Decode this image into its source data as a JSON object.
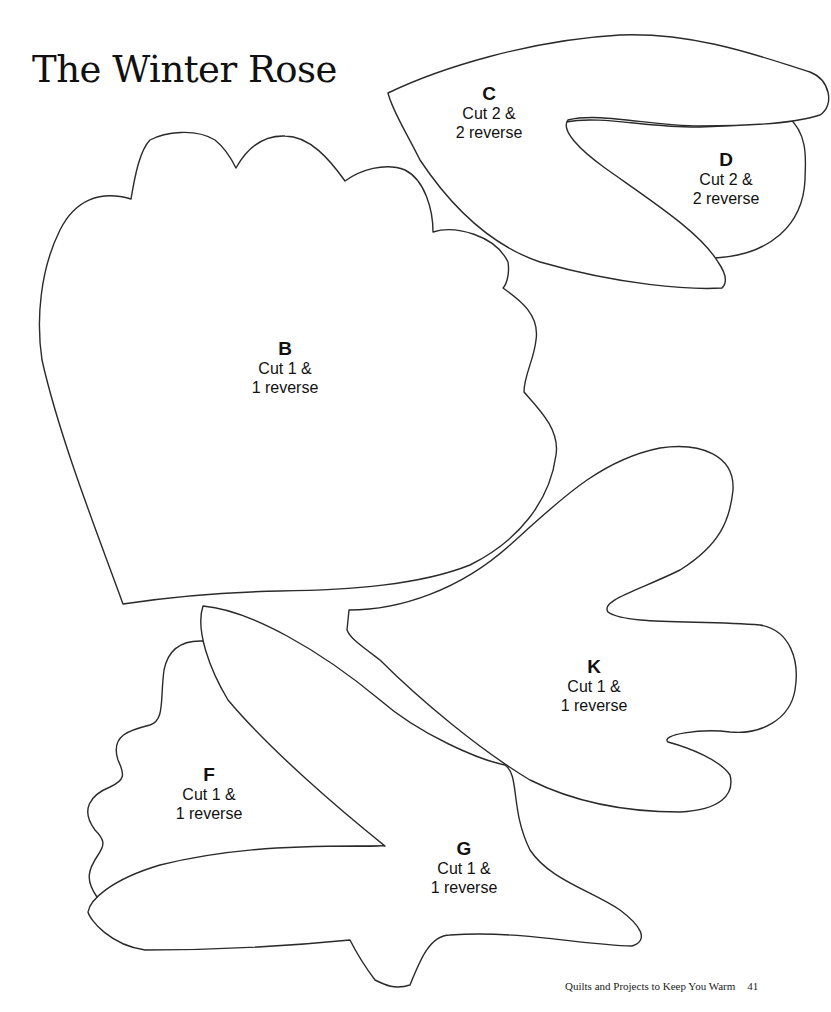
{
  "title": "The Winter Rose",
  "pieces": [
    {
      "id": "C",
      "letter": "C",
      "line1": "Cut 2 &",
      "line2": "2 reverse"
    },
    {
      "id": "D",
      "letter": "D",
      "line1": "Cut 2 &",
      "line2": "2 reverse"
    },
    {
      "id": "B",
      "letter": "B",
      "line1": "Cut 1 &",
      "line2": "1 reverse"
    },
    {
      "id": "K",
      "letter": "K",
      "line1": "Cut 1 &",
      "line2": "1 reverse"
    },
    {
      "id": "F",
      "letter": "F",
      "line1": "Cut 1 &",
      "line2": "1 reverse"
    },
    {
      "id": "G",
      "letter": "G",
      "line1": "Cut 1 &",
      "line2": "1 reverse"
    }
  ],
  "footer": {
    "book_title": "Quilts and Projects to Keep You Warm",
    "page_number": "41"
  },
  "colors": {
    "outline": "#2a2a2a",
    "background": "#ffffff",
    "text": "#111111"
  }
}
